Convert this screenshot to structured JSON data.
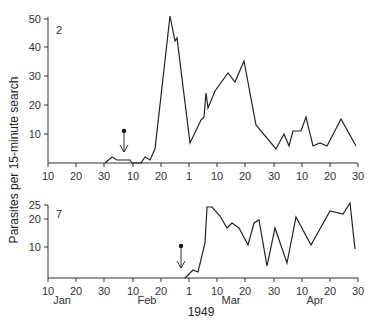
{
  "chart_data": [
    {
      "type": "line",
      "panel_label": "2",
      "title": "",
      "xlabel": "1949",
      "ylabel": "Parasites per 15-minute search",
      "ylim": [
        0,
        50
      ],
      "yticks": [
        10,
        20,
        30,
        40,
        50
      ],
      "x_tick_labels": [
        "10",
        "20",
        "30",
        "10",
        "20",
        "1",
        "10",
        "20",
        "30",
        "10",
        "20",
        "30"
      ],
      "x_tick_dates": [
        "Jan 10",
        "Jan 20",
        "Jan 30",
        "Feb 10",
        "Feb 20",
        "Mar 1",
        "Mar 10",
        "Mar 20",
        "Mar 30",
        "Apr 10",
        "Apr 20",
        "Apr 30"
      ],
      "grid": false,
      "annotation": {
        "type": "release-arrow",
        "date": "Feb 7"
      },
      "series": [
        {
          "name": "Parasites",
          "x": [
            "Jan 30",
            "Feb 2",
            "Feb 4",
            "Feb 8",
            "Feb 9",
            "Feb 13",
            "Feb 14",
            "Feb 16",
            "Feb 18",
            "Feb 23",
            "Feb 25",
            "Feb 26",
            "Mar 1",
            "Mar 5",
            "Mar 6",
            "Mar 7",
            "Mar 8",
            "Mar 10",
            "Mar 15",
            "Mar 17",
            "Mar 20",
            "Mar 25",
            "Apr 1",
            "Apr 4",
            "Apr 5",
            "Apr 7",
            "Apr 10",
            "Apr 11",
            "Apr 14",
            "Apr 16",
            "Apr 19",
            "Apr 24",
            "Apr 29"
          ],
          "values": [
            0,
            2,
            1,
            1,
            0,
            0,
            2,
            1,
            5,
            51,
            42,
            43,
            7,
            15,
            16,
            24,
            19,
            25,
            31,
            28,
            35,
            13,
            5,
            10,
            6,
            11,
            11,
            16,
            6,
            7,
            6,
            15,
            6
          ]
        }
      ]
    },
    {
      "type": "line",
      "panel_label": "7",
      "title": "",
      "xlabel": "1949",
      "ylabel": "Parasites per 15-minute search",
      "ylim": [
        0,
        25
      ],
      "yticks": [
        10,
        20,
        25
      ],
      "x_tick_labels": [
        "10",
        "20",
        "30",
        "10",
        "20",
        "1",
        "10",
        "20",
        "30",
        "10",
        "20",
        "30"
      ],
      "month_labels": [
        "Jan",
        "Feb",
        "Mar",
        "Apr"
      ],
      "grid": false,
      "annotation": {
        "type": "release-arrow",
        "date": "Feb 27"
      },
      "series": [
        {
          "name": "Parasites",
          "x": [
            "Feb 28",
            "Mar 3",
            "Mar 4",
            "Mar 7",
            "Mar 7b",
            "Mar 9",
            "Mar 12",
            "Mar 14",
            "Mar 16",
            "Mar 18",
            "Mar 22",
            "Mar 24",
            "Mar 26",
            "Mar 28",
            "Mar 31",
            "Apr 4",
            "Apr 7",
            "Apr 13",
            "Apr 19",
            "Apr 24",
            "Apr 26",
            "Apr 28"
          ],
          "values": [
            0,
            3,
            2,
            12,
            24,
            24,
            21,
            17,
            19,
            17,
            11,
            19,
            20,
            4,
            17,
            5,
            21,
            11,
            23,
            22,
            26,
            10
          ]
        }
      ]
    }
  ],
  "labels": {
    "ylabel": "Parasites per 15-minute search",
    "year": "1949",
    "months": [
      "Jan",
      "Feb",
      "Mar",
      "Apr"
    ],
    "panel_top": "2",
    "panel_bottom": "7"
  },
  "geometry": {
    "x_ticks_px": [
      48,
      76,
      104,
      133,
      161,
      189,
      217,
      245,
      274,
      302,
      330,
      358
    ],
    "top": {
      "baseline": 163,
      "y_ticks_px": {
        "10": 134,
        "20": 105,
        "30": 76,
        "40": 47,
        "50": 19
      },
      "points_px": [
        [
          105,
          163
        ],
        [
          112,
          157
        ],
        [
          117,
          160
        ],
        [
          130,
          160
        ],
        [
          132,
          163
        ],
        [
          141,
          163
        ],
        [
          145,
          157
        ],
        [
          150,
          160
        ],
        [
          155,
          149
        ],
        [
          170,
          16
        ],
        [
          175,
          41
        ],
        [
          177,
          38
        ],
        [
          190,
          143
        ],
        [
          201,
          120
        ],
        [
          204,
          117
        ],
        [
          206,
          93
        ],
        [
          208,
          108
        ],
        [
          215,
          91
        ],
        [
          228,
          73
        ],
        [
          235,
          82
        ],
        [
          244,
          61
        ],
        [
          256,
          125
        ],
        [
          276,
          149
        ],
        [
          284,
          134
        ],
        [
          289,
          146
        ],
        [
          293,
          131
        ],
        [
          301,
          131
        ],
        [
          306,
          117
        ],
        [
          313,
          146
        ],
        [
          320,
          143
        ],
        [
          327,
          146
        ],
        [
          341,
          119
        ],
        [
          356,
          146
        ]
      ],
      "arrow": {
        "x": 124,
        "dot_y": 131,
        "tip_y": 152
      }
    },
    "bottom": {
      "baseline": 278,
      "y_ticks_px": {
        "10": 247,
        "20": 219,
        "25": 205
      },
      "points_px": [
        [
          185,
          278
        ],
        [
          193,
          270
        ],
        [
          198,
          272
        ],
        [
          205,
          243
        ],
        [
          207,
          207
        ],
        [
          212,
          207
        ],
        [
          220,
          216
        ],
        [
          227,
          228
        ],
        [
          232,
          223
        ],
        [
          239,
          228
        ],
        [
          248,
          245
        ],
        [
          254,
          223
        ],
        [
          259,
          220
        ],
        [
          267,
          266
        ],
        [
          275,
          228
        ],
        [
          287,
          263
        ],
        [
          296,
          217
        ],
        [
          311,
          245
        ],
        [
          330,
          211
        ],
        [
          343,
          214
        ],
        [
          350,
          203
        ],
        [
          355,
          249
        ]
      ],
      "arrow": {
        "x": 181,
        "dot_y": 246,
        "tip_y": 268
      }
    }
  }
}
